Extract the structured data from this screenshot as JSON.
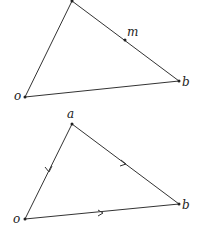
{
  "diagrams": [
    {
      "labels": {
        "a": "a",
        "m": "m",
        "b": "b",
        "o": "o"
      }
    },
    {
      "labels": {
        "a": "a",
        "b": "b",
        "o": "o"
      }
    }
  ]
}
